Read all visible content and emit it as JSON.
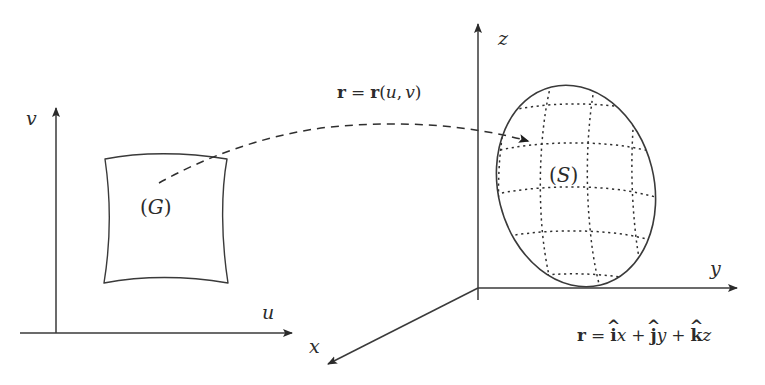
{
  "figure": {
    "background_color": "#ffffff",
    "stroke_color": "#3a3a3a",
    "text_color": "#2b2b2b",
    "width": 765,
    "height": 385
  },
  "uv_plane": {
    "v_axis_label": "v",
    "u_axis_label": "u",
    "region_label_open": "(",
    "region_label_symbol": "G",
    "region_label_close": ")"
  },
  "xyz_space": {
    "z_axis_label": "z",
    "y_axis_label": "y",
    "x_axis_label": "x",
    "surface_label_open": "(",
    "surface_label_symbol": "S",
    "surface_label_close": ")"
  },
  "mapping_formula": {
    "lhs_vector": "r",
    "equals": "=",
    "rhs_vector": "r",
    "open_paren": "(",
    "param_u": "u",
    "comma": ",",
    "param_v": "v",
    "close_paren": ")"
  },
  "position_formula": {
    "lhs_vector": "r",
    "equals": "=",
    "i_hat": "i",
    "i_hat_mark": "^",
    "x": "x",
    "plus_1": "+",
    "j_hat": "j",
    "j_hat_mark": "^",
    "y": "y",
    "plus_2": "+",
    "k_hat": "k",
    "k_hat_mark": "^",
    "z": "z"
  },
  "icons": {
    "v_axis_arrow": "arrow-up-icon",
    "u_axis_arrow": "arrow-right-icon",
    "z_axis_arrow": "arrow-up-icon",
    "y_axis_arrow": "arrow-right-icon",
    "x_axis_arrow": "arrow-down-left-icon",
    "mapping_arrow": "dashed-curved-arrow-icon"
  }
}
